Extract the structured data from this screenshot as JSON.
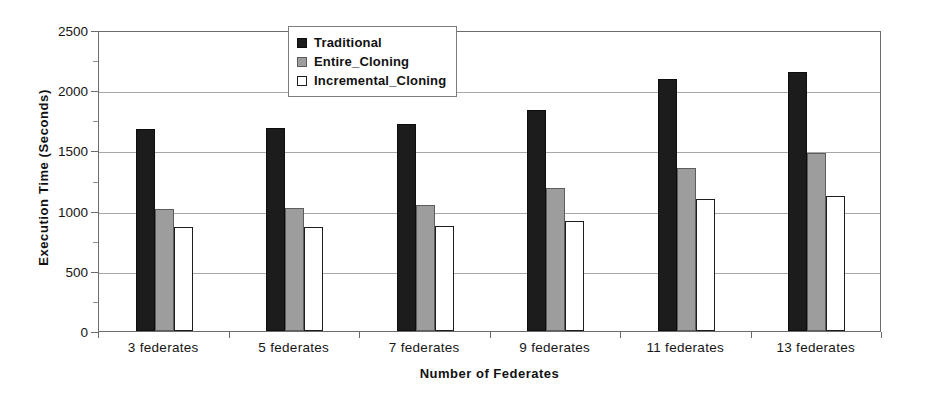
{
  "chart_data": {
    "type": "bar",
    "title": "",
    "xlabel": "Number of Federates",
    "ylabel": "Execution Time (Seconds)",
    "categories": [
      "3 federates",
      "5 federates",
      "7 federates",
      "9 federates",
      "11 federates",
      "13 federates"
    ],
    "series": [
      {
        "name": "Traditional",
        "color": "#1c1c1c",
        "values": [
          1675,
          1690,
          1720,
          1835,
          2090,
          2155
        ]
      },
      {
        "name": "Entire_Cloning",
        "color": "#9d9d9d",
        "values": [
          1010,
          1025,
          1045,
          1190,
          1350,
          1475
        ]
      },
      {
        "name": "Incremental_Cloning",
        "color": "#ffffff",
        "values": [
          860,
          865,
          875,
          915,
          1100,
          1125
        ]
      }
    ],
    "ylim": [
      0,
      2500
    ],
    "yticks": [
      0,
      500,
      1000,
      1500,
      2000,
      2500
    ],
    "ytick_labels": [
      "0",
      "500",
      "1000",
      "1500",
      "2000",
      "2500"
    ],
    "grid": true,
    "legend_position": "top-center"
  },
  "legend": {
    "entries": [
      {
        "label": "Traditional"
      },
      {
        "label": "Entire_Cloning"
      },
      {
        "label": "Incremental_Cloning"
      }
    ]
  }
}
